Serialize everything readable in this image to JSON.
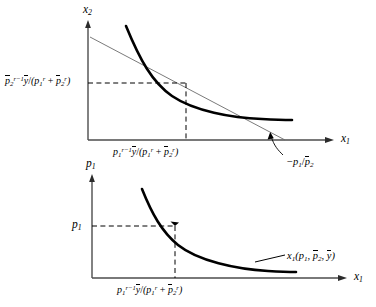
{
  "figure": {
    "type": "two-panel-economics-diagram",
    "ink_color": "#000000",
    "thin_line_color": "#555555",
    "background": "#ffffff"
  },
  "upper_panel": {
    "name": "indifference-curve-panel",
    "y_axis_label": "x2",
    "x_axis_label": "x1",
    "y_tick_label": {
      "parts": {
        "base": "p",
        "base_sub": "2",
        "base_sup": "r-1",
        "numerator": "y",
        "denominator": "(p1^r + p2^r)"
      },
      "plain": "p2^(r-1) y / (p1^r + p2^r)"
    },
    "x_tick_label": {
      "parts": {
        "base": "p",
        "base_sub": "1",
        "base_sup": "r-1",
        "numerator": "y",
        "denominator": "(p1^r + p2^r)"
      },
      "plain": "p1^(r-1) y / (p1^r + p2^r)"
    },
    "slope_annotation": {
      "plain": "-p1 / p2",
      "leader": "diagonal leader line pointing up-left to the budget line"
    },
    "curves": {
      "indifference_curve": "thick convex decreasing curve",
      "budget_line": "thin straight decreasing line tangent at the optimum",
      "dashed_guides": "horizontal and vertical dashed lines from the tangency point to the axes"
    }
  },
  "lower_panel": {
    "name": "demand-curve-panel",
    "y_axis_label": "p1",
    "x_axis_label": "x1",
    "y_tick_label": {
      "plain": "p1"
    },
    "x_tick_label": {
      "parts": {
        "base": "p",
        "base_sub": "1",
        "base_sup": "r-1",
        "numerator": "y",
        "denominator": "(p1^r + p2^r)"
      },
      "plain": "p1^(r-1) y / (p1^r + p2^r)"
    },
    "curve_label": {
      "plain": "x1(p1, p2, y)"
    },
    "curves": {
      "demand_curve": "thick convex decreasing curve",
      "dashed_guides": "horizontal and vertical dashed lines from the point on the demand curve to the axes"
    }
  },
  "symbols": {
    "x": "x",
    "p": "p",
    "y": "y",
    "r": "r",
    "one": "1",
    "two": "2",
    "r_minus_1": "r−1",
    "minus": "−",
    "slash": "/",
    "plus": "+",
    "lparen": "(",
    "rparen": ")",
    "comma": ","
  }
}
